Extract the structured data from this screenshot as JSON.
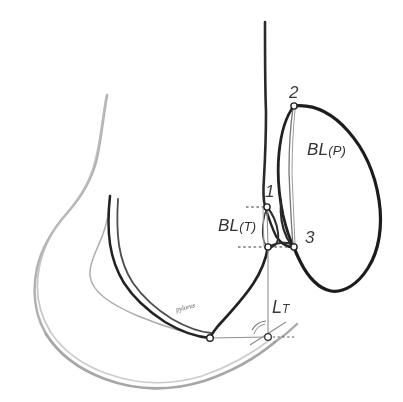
{
  "figure": {
    "background_color": "#ffffff",
    "width": 403,
    "height": 402,
    "ink_dark": "#1f1f1f",
    "ink_mid": "#5a5a5a",
    "ink_light": "#9a9a9a",
    "ink_faint": "#b3b3b3"
  },
  "labels": {
    "point_1": "1",
    "point_2": "2",
    "point_3": "3",
    "bl_p_main": "BL",
    "bl_p_sub": "(P)",
    "bl_t_main": "BL",
    "bl_t_sub": "(T)",
    "lt_main": "L",
    "lt_sub": "T",
    "handwritten_note": "pylorus"
  },
  "markers": [
    {
      "name": "marker-point-1",
      "x": 267,
      "y": 207,
      "r": 3.1
    },
    {
      "name": "marker-point-2",
      "x": 294,
      "y": 106,
      "r": 3.1
    },
    {
      "name": "marker-point-3",
      "x": 294,
      "y": 247,
      "r": 3.1
    },
    {
      "name": "marker-bl-t-lower",
      "x": 268,
      "y": 247,
      "r": 3.1
    },
    {
      "name": "marker-greater-curve-low",
      "x": 210,
      "y": 338,
      "r": 3.3
    },
    {
      "name": "marker-angle-vertex",
      "x": 268,
      "y": 337,
      "r": 3.3
    }
  ],
  "guides": {
    "dashed_upper_label": "horizontal guide at point 1",
    "dashed_lower_label": "horizontal guide at point 3",
    "dashed_right_label": "horizontal guide right of angle vertex",
    "vertical_bl_t_label": "vertical bulb-thickness caliper",
    "vertical_lt_label": "vertical drop to angle vertex",
    "baseline_label": "horizontal baseline through lower markers",
    "angle_arc_label": "angle arc at L subscript T vertex"
  }
}
